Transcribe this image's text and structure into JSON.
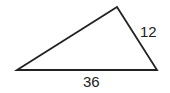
{
  "diagram": {
    "type": "triangle",
    "vertices": [
      [
        17,
        70
      ],
      [
        117,
        7
      ],
      [
        157,
        70
      ]
    ],
    "stroke_color": "#222222",
    "labels": {
      "right_side": "12",
      "base": "36"
    }
  }
}
